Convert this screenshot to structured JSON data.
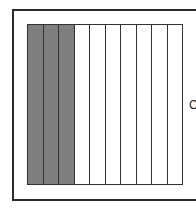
{
  "diagram": {
    "type": "fraction-model",
    "total_columns": 10,
    "shaded_columns": 3,
    "shaded_fraction": "3/10",
    "shade_color": "#7e7e7e",
    "line_color": "#333333",
    "side_label": "C",
    "columns": [
      {
        "shaded": true
      },
      {
        "shaded": true
      },
      {
        "shaded": true
      },
      {
        "shaded": false
      },
      {
        "shaded": false
      },
      {
        "shaded": false
      },
      {
        "shaded": false
      },
      {
        "shaded": false
      },
      {
        "shaded": false
      },
      {
        "shaded": false
      }
    ]
  }
}
